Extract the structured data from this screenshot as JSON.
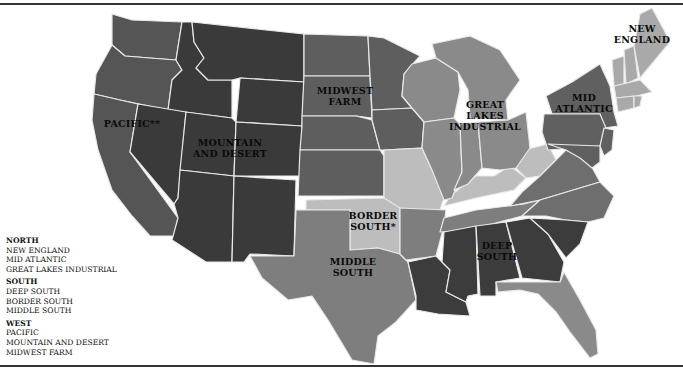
{
  "colors": {
    "background": "#ffffff",
    "border": "#e8e8e8",
    "mountain_desert": "#3a3a3a",
    "deep_south": "#3c3c3c",
    "pacific": "#555555",
    "midwest_farm": "#5e5e5e",
    "mid_atlantic": "#606060",
    "great_lakes": "#8a8a8a",
    "middle_south": "#7e7e7e",
    "border_south": "#bdbdbd",
    "new_england": "#a9a9a9",
    "southeast_other": "#6e6e6e",
    "florida": "#8a8a8a"
  },
  "map": {
    "labels": {
      "pacific": "PACIFIC**",
      "mountain_1": "MOUNTAIN",
      "mountain_2": "AND DESERT",
      "midwest_1": "MIDWEST",
      "midwest_2": "FARM",
      "great_lakes_1": "GREAT",
      "great_lakes_2": "LAKES",
      "great_lakes_3": "INDUSTRIAL",
      "mid_atlantic_1": "MID",
      "mid_atlantic_2": "ATLANTIC",
      "new_england_1": "NEW",
      "new_england_2": "ENGLAND",
      "border_south_1": "BORDER",
      "border_south_2": "SOUTH*",
      "middle_south_1": "MIDDLE",
      "middle_south_2": "SOUTH",
      "deep_south_1": "DEEP",
      "deep_south_2": "SOUTH"
    }
  },
  "legend": {
    "groups": [
      {
        "header": "NORTH",
        "items": [
          "NEW ENGLAND",
          "MID ATLANTIC",
          "GREAT LAKES INDUSTRIAL"
        ]
      },
      {
        "header": "SOUTH",
        "items": [
          "DEEP SOUTH",
          "BORDER SOUTH",
          "MIDDLE SOUTH"
        ]
      },
      {
        "header": "WEST",
        "items": [
          "PACIFIC",
          "MOUNTAIN AND DESERT",
          "MIDWEST FARM"
        ]
      }
    ]
  }
}
